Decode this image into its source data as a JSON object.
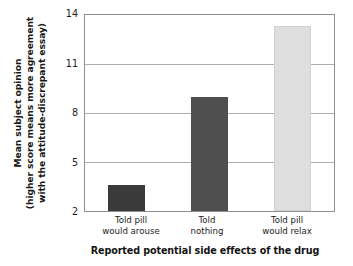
{
  "chart_data": {
    "type": "bar",
    "title": "",
    "subtitle": "",
    "xlabel": "Reported potential side effects of the drug",
    "ylabel_lines": [
      "Mean subject opinion",
      "(higher score means more agreement",
      "with the attitude-discrepant essay)"
    ],
    "ylabel": "Mean subject opinion (higher score means more agreement with the attitude-discrepant essay)",
    "categories": [
      "Told pill would arouse",
      "Told nothing",
      "Told pill would relax"
    ],
    "category_lines": [
      [
        "Told pill",
        "would arouse"
      ],
      [
        "Told",
        "nothing"
      ],
      [
        "Told pill",
        "would relax"
      ]
    ],
    "values": [
      3.6,
      9.0,
      13.3
    ],
    "ylim": [
      2,
      14
    ],
    "yticks": [
      14,
      11,
      8,
      5,
      2
    ],
    "ytick_labels": [
      "14",
      "11",
      "8",
      "5",
      "2"
    ],
    "grid": true,
    "grid_axis": "y",
    "legend": "none",
    "bar_colors": [
      "#3a3a3a",
      "#4f4f4f",
      "#dedede"
    ],
    "grid_color": "#adadad",
    "frame_color": "#8f8f8f",
    "text_color": "#1b1b1b",
    "background": "#ffffff"
  }
}
